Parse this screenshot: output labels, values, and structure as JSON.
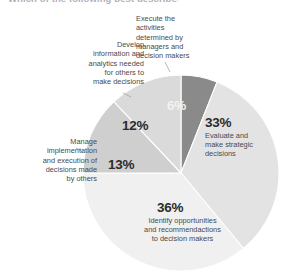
{
  "figure": {
    "cut_off_title": "Which of the following best describes",
    "type": "pie-chart"
  },
  "chart_data": {
    "type": "pie",
    "title": "",
    "subtitle": "",
    "xlabel": "",
    "ylabel": "",
    "grid": false,
    "legend_position": "callout-labels",
    "units": "percent",
    "total": 100,
    "start_angle_deg": 0,
    "direction": "clockwise",
    "categories": [
      "Execute the activities determined by managers and decision makers",
      "Evaluate and make strategic decisions",
      "Identify opportunities and recommendactions to decision makers",
      "Manage implementation and execution of decisions made by others",
      "Develop information and analytics needed for others to make decisions"
    ],
    "values": [
      6,
      33,
      36,
      13,
      12
    ],
    "value_labels": [
      "6%",
      "33%",
      "36%",
      "13%",
      "12%"
    ],
    "colors": [
      "#8a8a8a",
      "#e3e3e3",
      "#f0f0f0",
      "#cfcfcf",
      "#dadada"
    ],
    "slices": [
      {
        "value": 6,
        "value_label": "6%",
        "label": "Execute the\nactivities\ndetermined by\nmanagers and\ndecision makers",
        "label_placement": "callout-top",
        "color": "#8a8a8a",
        "label_color_on_slice": "light"
      },
      {
        "value": 33,
        "value_label": "33%",
        "label": "Evaluate and\nmake strategic\ndecisions",
        "label_placement": "inside-right",
        "color": "#e3e3e3",
        "label_color_on_slice": "dark"
      },
      {
        "value": 36,
        "value_label": "36%",
        "label": "Identify opportunities\nand recommendactions\nto decision makers",
        "label_placement": "inside-bottom",
        "color": "#f0f0f0",
        "label_color_on_slice": "dark"
      },
      {
        "value": 13,
        "value_label": "13%",
        "label": "Manage\nimplementation\nand execution of\ndecisions made\nby others",
        "label_placement": "callout-left",
        "color": "#cfcfcf",
        "label_color_on_slice": "dark"
      },
      {
        "value": 12,
        "value_label": "12%",
        "label": "Develop\ninformation and\nanalytics needed\nfor others to\nmake decisions",
        "label_placement": "callout-upper-left",
        "color": "#dadada",
        "label_color_on_slice": "dark"
      }
    ]
  }
}
